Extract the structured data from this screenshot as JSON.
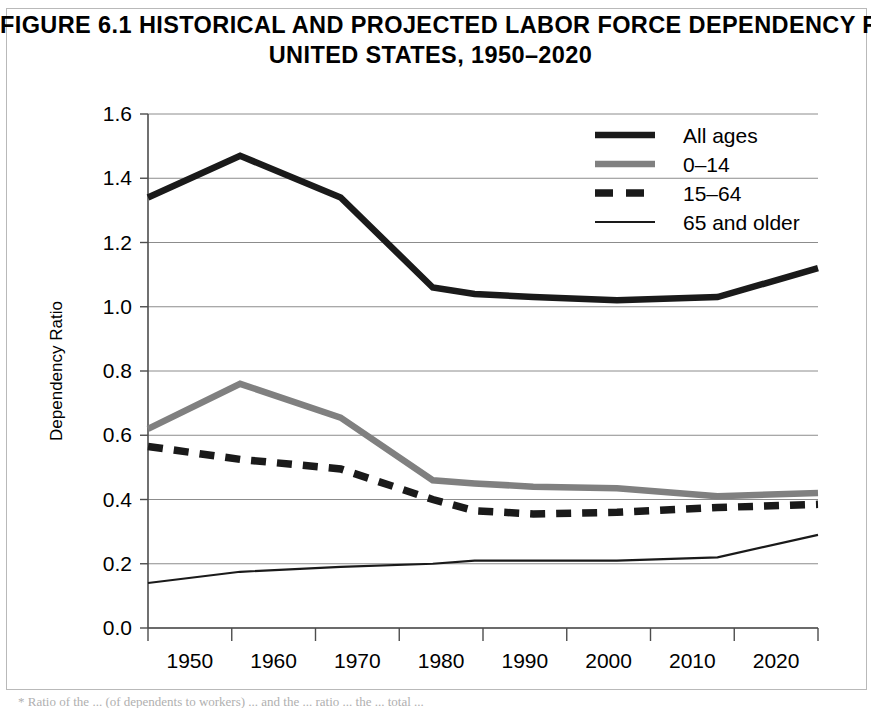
{
  "figure": {
    "title_line_1": "FIGURE 6.1 HISTORICAL AND PROJECTED LABOR FORCE DEPENDENCY RATIOS,*",
    "title_line_2": "UNITED STATES, 1950–2020",
    "footnote": "* Ratio of the ... (of dependents to workers) ... and the ... ratio ... the ... total ..."
  },
  "colors": {
    "all_ages": "#1a1a1a",
    "age_0_14": "#808080",
    "age_15_64": "#1a1a1a",
    "age_65_older": "#1a1a1a",
    "gridline": "#8c8c8c",
    "axis": "#4d4d4d",
    "frame": "#b9b9b9",
    "background": "#ffffff"
  },
  "chart_data": {
    "type": "line",
    "title": "FIGURE 6.1 HISTORICAL AND PROJECTED LABOR FORCE DEPENDENCY RATIOS,* UNITED STATES, 1950–2020",
    "xlabel": "",
    "ylabel": "Dependency Ratio",
    "xlim": [
      1945,
      2025
    ],
    "ylim": [
      0.0,
      1.6
    ],
    "ytick_labels": [
      "0.0",
      "0.2",
      "0.4",
      "0.6",
      "0.8",
      "1.0",
      "1.2",
      "1.4",
      "1.6"
    ],
    "ytick_values": [
      0.0,
      0.2,
      0.4,
      0.6,
      0.8,
      1.0,
      1.2,
      1.4,
      1.6
    ],
    "xtick_labels": [
      "1950",
      "1960",
      "1970",
      "1980",
      "1990",
      "2000",
      "2010",
      "2020"
    ],
    "xtick_values": [
      1950,
      1960,
      1970,
      1980,
      1990,
      2000,
      2010,
      2020
    ],
    "grid": true,
    "legend_position": "top-right",
    "series": [
      {
        "name": "All ages",
        "style": "thick-solid",
        "color": "#1a1a1a",
        "x": [
          1945,
          1956,
          1968,
          1979,
          1984,
          1991,
          2001,
          2013,
          2025
        ],
        "values": [
          1.34,
          1.47,
          1.34,
          1.06,
          1.04,
          1.03,
          1.02,
          1.03,
          1.12
        ]
      },
      {
        "name": "0–14",
        "style": "thick-solid",
        "color": "#808080",
        "x": [
          1945,
          1956,
          1968,
          1979,
          1984,
          1991,
          2001,
          2013,
          2025
        ],
        "values": [
          0.62,
          0.76,
          0.655,
          0.46,
          0.45,
          0.44,
          0.435,
          0.41,
          0.42
        ]
      },
      {
        "name": "15–64",
        "style": "dashed",
        "color": "#1a1a1a",
        "x": [
          1945,
          1956,
          1968,
          1979,
          1984,
          1991,
          2001,
          2013,
          2025
        ],
        "values": [
          0.565,
          0.525,
          0.495,
          0.4,
          0.365,
          0.355,
          0.36,
          0.375,
          0.385
        ]
      },
      {
        "name": "65 and older",
        "style": "thin-solid",
        "color": "#1a1a1a",
        "x": [
          1945,
          1956,
          1968,
          1979,
          1984,
          1991,
          2001,
          2013,
          2025
        ],
        "values": [
          0.14,
          0.175,
          0.19,
          0.2,
          0.21,
          0.21,
          0.21,
          0.22,
          0.29
        ]
      }
    ]
  },
  "legend": {
    "items": [
      {
        "label": "All ages"
      },
      {
        "label": "0–14"
      },
      {
        "label": "15–64"
      },
      {
        "label": "65 and older"
      }
    ]
  }
}
